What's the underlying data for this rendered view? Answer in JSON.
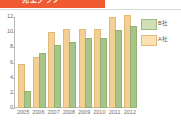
{
  "banner": {
    "title": "売上グラフ",
    "bg_color": "#f05a32"
  },
  "legend": {
    "position": "top-right",
    "entries": [
      {
        "label": "B社",
        "color": "#a8c48a",
        "swatch": "#cfdfb8"
      },
      {
        "label": "A社",
        "color": "#f3cf94",
        "swatch": "#fbe0b4"
      }
    ]
  },
  "chart_data": {
    "type": "bar",
    "title": "売上グラフ",
    "xlabel": "",
    "ylabel": "",
    "ylim": [
      0,
      12
    ],
    "yticks": [
      0,
      2,
      4,
      6,
      8,
      10,
      12
    ],
    "grid": false,
    "categories": [
      "2005",
      "2006",
      "2007",
      "2008",
      "2009",
      "2010",
      "2011",
      "2012"
    ],
    "series": [
      {
        "name": "A社",
        "color": "#f3cf94",
        "values": [
          5.5,
          6.5,
          9.7,
          10.2,
          10.2,
          10.2,
          11.8,
          12.0
        ]
      },
      {
        "name": "B社",
        "color": "#a8c48a",
        "values": [
          2.0,
          7.0,
          8.1,
          8.4,
          9.0,
          9.0,
          10.0,
          10.5
        ]
      }
    ]
  }
}
